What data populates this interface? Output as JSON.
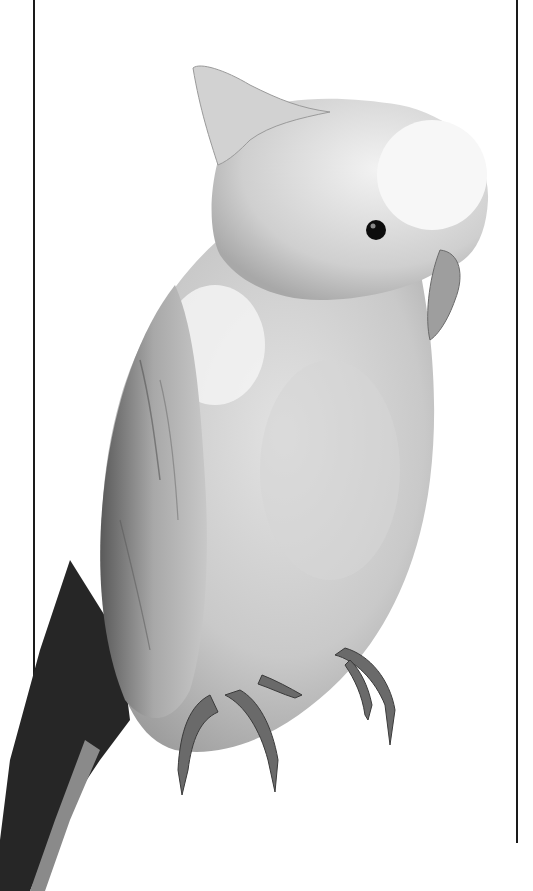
{
  "image": {
    "subject": "cockatoo perched, grayscale photograph",
    "alt": "Grayscale photograph of a cockatoo with folded crest, perched, facing right",
    "background": "#ffffff",
    "colors": {
      "line": "#1a1a1a",
      "body_light": "#e8e8e8",
      "body_mid": "#c4c4c4",
      "body_shadow": "#9a9a9a",
      "tail_dark": "#262626",
      "eye": "#0d0d0d",
      "feet": "#6a6a6a"
    }
  }
}
